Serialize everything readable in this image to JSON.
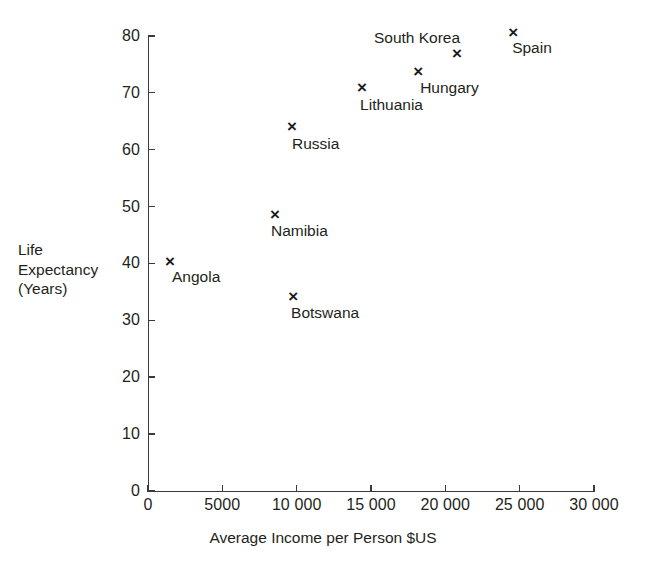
{
  "chart_data": {
    "type": "scatter",
    "title": "",
    "xlabel": "Average Income per Person $US",
    "ylabel": "Life\nExpectancy\n(Years)",
    "xlim": [
      0,
      30000
    ],
    "ylim": [
      0,
      80
    ],
    "grid": false,
    "legend": "none",
    "marker": "x",
    "xticks": [
      {
        "value": 0,
        "label": "0"
      },
      {
        "value": 5000,
        "label": "5000"
      },
      {
        "value": 10000,
        "label": "10 000"
      },
      {
        "value": 15000,
        "label": "15 000"
      },
      {
        "value": 20000,
        "label": "20 000"
      },
      {
        "value": 25000,
        "label": "25 000"
      },
      {
        "value": 30000,
        "label": "30 000"
      }
    ],
    "yticks": [
      {
        "value": 0,
        "label": "0"
      },
      {
        "value": 10,
        "label": "10"
      },
      {
        "value": 20,
        "label": "20"
      },
      {
        "value": 30,
        "label": "30"
      },
      {
        "value": 40,
        "label": "40"
      },
      {
        "value": 50,
        "label": "50"
      },
      {
        "value": 60,
        "label": "60"
      },
      {
        "value": 70,
        "label": "70"
      },
      {
        "value": 80,
        "label": "80"
      }
    ],
    "points": [
      {
        "name": "Angola",
        "x": 1480,
        "y": 40.2,
        "label_dx": 2,
        "label_dy": 6
      },
      {
        "name": "Botswana",
        "x": 9760,
        "y": 34.1,
        "label_dx": -2,
        "label_dy": 7
      },
      {
        "name": "Namibia",
        "x": 8540,
        "y": 48.5,
        "label_dx": -4,
        "label_dy": 7
      },
      {
        "name": "Russia",
        "x": 9690,
        "y": 64.0,
        "label_dx": 0,
        "label_dy": 8
      },
      {
        "name": "Lithuania",
        "x": 14400,
        "y": 70.8,
        "label_dx": -2,
        "label_dy": 8
      },
      {
        "name": "Hungary",
        "x": 18170,
        "y": 73.6,
        "label_dx": 2,
        "label_dy": 7
      },
      {
        "name": "South Korea",
        "x": 20780,
        "y": 76.8,
        "label_dx": -83,
        "label_dy": -25
      },
      {
        "name": "Spain",
        "x": 24560,
        "y": 80.5,
        "label_dx": -1,
        "label_dy": 6
      }
    ]
  }
}
